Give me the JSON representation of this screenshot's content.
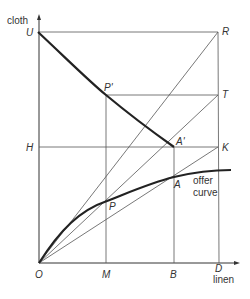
{
  "axes": {
    "y_label": "cloth",
    "x_label": "linen"
  },
  "points": {
    "U": "U",
    "R": "R",
    "P_prime": "P'",
    "T": "T",
    "H": "H",
    "A_prime": "A'",
    "K": "K",
    "A": "A",
    "P": "P",
    "O": "O",
    "M": "M",
    "B": "B",
    "D": "D"
  },
  "annotations": {
    "offer_curve_line1": "offer",
    "offer_curve_line2": "curve"
  }
}
